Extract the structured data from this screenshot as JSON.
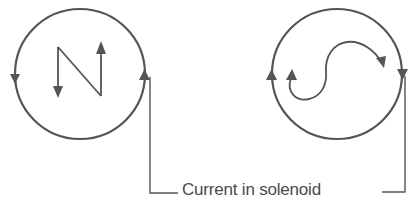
{
  "diagram": {
    "label": "Current in solenoid",
    "colors": {
      "stroke": "#555555",
      "background": "#ffffff",
      "text": "#4a4a4a"
    },
    "left_end": {
      "pole_letter": "N",
      "current_direction": "counter-clockwise",
      "description": "N drawn with arrows; circle arrows: left side pointing down, right side pointing up"
    },
    "right_end": {
      "pole_letter": "S",
      "current_direction": "clockwise",
      "description": "S drawn as curved arrow; circle arrows: left side pointing up, right side pointing down"
    }
  }
}
